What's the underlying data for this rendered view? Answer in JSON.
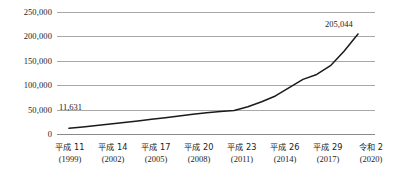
{
  "chart_data": {
    "type": "line",
    "title": "",
    "subtitle": "",
    "xlabel": "",
    "ylabel": "",
    "grid": true,
    "legend": "none",
    "ylim": [
      0,
      250000
    ],
    "yticks": [
      250000,
      200000,
      150000,
      100000,
      50000,
      0
    ],
    "ytick_labels": [
      "250,000",
      "200,000",
      "150,000",
      "100,000",
      "50,000",
      "0"
    ],
    "xtick_labels": [
      {
        "era": "平成 11",
        "year": "(1999)"
      },
      {
        "era": "平成 14",
        "year": "(2002)"
      },
      {
        "era": "平成 17",
        "year": "(2005)"
      },
      {
        "era": "平成 20",
        "year": "(2008)"
      },
      {
        "era": "平成 23",
        "year": "(2011)"
      },
      {
        "era": "平成 26",
        "year": "(2014)"
      },
      {
        "era": "平成 29",
        "year": "(2017)"
      },
      {
        "era": "令和 2",
        "year": "(2020)"
      }
    ],
    "x": [
      1999,
      2000,
      2001,
      2002,
      2003,
      2004,
      2005,
      2006,
      2007,
      2008,
      2009,
      2010,
      2011,
      2012,
      2013,
      2014,
      2015,
      2016,
      2017,
      2018,
      2019,
      2020
    ],
    "values": [
      11631,
      14500,
      17500,
      20500,
      23500,
      26500,
      30000,
      33500,
      37000,
      40500,
      43500,
      46000,
      48000,
      56000,
      66000,
      78000,
      95000,
      112000,
      122000,
      140000,
      170000,
      205044
    ],
    "annotations": [
      {
        "label": "11,631",
        "x": 1999,
        "y": 11631
      },
      {
        "label": "205,044",
        "x": 2020,
        "y": 205044
      }
    ],
    "series": [
      {
        "name": "",
        "color": "#1a1a1a",
        "values": [
          11631,
          14500,
          17500,
          20500,
          23500,
          26500,
          30000,
          33500,
          37000,
          40500,
          43500,
          46000,
          48000,
          56000,
          66000,
          78000,
          95000,
          112000,
          122000,
          140000,
          170000,
          205044
        ]
      }
    ]
  }
}
